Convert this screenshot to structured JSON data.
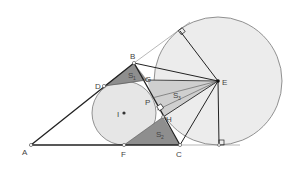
{
  "diagram": {
    "title": "",
    "colors": {
      "circle_fill": "#ececec",
      "circle_stroke": "#777777",
      "dark_shade": "#8e8e8e",
      "light_shade": "#cfcfcf",
      "line": "#222222",
      "thin_line": "#888888"
    },
    "points": {
      "A": {
        "label": "A",
        "x": 31,
        "y": 145
      },
      "B": {
        "label": "B",
        "x": 134,
        "y": 63
      },
      "C": {
        "label": "C",
        "x": 180,
        "y": 145
      },
      "D": {
        "label": "D",
        "x": 104,
        "y": 86
      },
      "F": {
        "label": "F",
        "x": 124,
        "y": 145
      },
      "I": {
        "label": "I",
        "x": 124,
        "y": 113
      },
      "E": {
        "label": "E",
        "x": 218,
        "y": 81
      },
      "G": {
        "label": "G",
        "x": 147,
        "y": 80
      },
      "P": {
        "label": "P",
        "x": 152,
        "y": 98
      },
      "H": {
        "label": "H",
        "x": 163,
        "y": 117
      },
      "T1": {
        "label": "",
        "x": 180,
        "y": 31
      },
      "T2": {
        "label": "",
        "x": 219,
        "y": 145
      }
    },
    "regions": {
      "S1": {
        "label": "S",
        "subscript": "1"
      },
      "S2": {
        "label": "S",
        "subscript": "2"
      },
      "S3": {
        "label": "S",
        "subscript": "3"
      }
    },
    "circles": {
      "incircle": {
        "center": "I",
        "r": 32
      },
      "excircle": {
        "center": "E",
        "r": 64
      }
    }
  }
}
